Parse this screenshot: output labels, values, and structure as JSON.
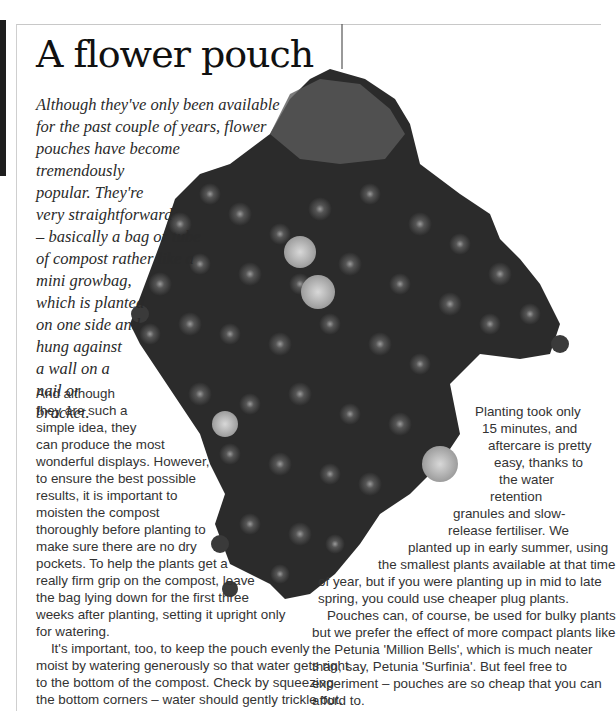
{
  "page": {
    "title": "A flower pouch",
    "intro_lines": [
      "Although they've only been available",
      "for the past couple of years, flower",
      "pouches have become",
      "tremendously",
      "popular. They're",
      "very straightforward",
      "– basically a bag or tube",
      "of compost rather like a",
      "mini growbag,",
      "which is planted",
      "on one side and",
      "hung against",
      "a wall on a",
      "nail or",
      "bracket."
    ],
    "left_body_lines": [
      "And although",
      "they are such a",
      "simple idea, they",
      "can produce the most",
      "wonderful displays. However,",
      "to ensure the best possible",
      "results, it is important to",
      "moisten the compost",
      "thoroughly before planting to",
      "make sure there are no dry",
      "pockets. To help the plants get a",
      "really firm grip on the compost, leave",
      "the bag lying down for the first three",
      "weeks after planting, setting it upright only",
      "for watering.",
      "    It's important, too, to keep the pouch evenly",
      "moist by watering generously so that water gets right",
      "to the bottom of the compost. Check by squeezing",
      "the bottom corners – water should gently trickle out."
    ],
    "right_body_lines": [
      "Planting took only",
      "15 minutes, and",
      "aftercare is pretty",
      "easy, thanks to",
      "the water",
      "retention",
      "granules and slow-",
      "release fertiliser. We",
      "planted up in early summer, using",
      "the smallest plants available at that time",
      "of year, but if you were planting up in mid to late",
      "spring, you could use cheaper plug plants.",
      "    Pouches can, of course, be used for bulky plants",
      "but we prefer the effect of more compact plants like",
      "the Petunia 'Million Bells', which is much neater",
      "than, say, Petunia 'Surfinia'. But feel free to",
      "experiment – pouches are so cheap that you can",
      "afford to."
    ],
    "photo": {
      "subject": "hanging flower pouch with petunias and marigolds",
      "tone": "grayscale"
    }
  }
}
